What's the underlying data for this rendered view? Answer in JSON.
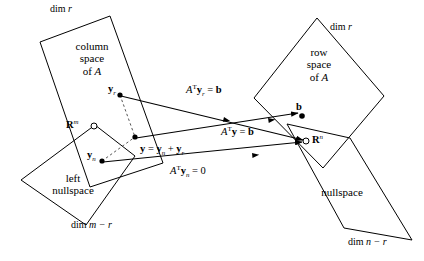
{
  "figure": {
    "stroke_color": "#000000",
    "background_color": "#ffffff",
    "dashed_color": "#555555"
  },
  "boxes": {
    "column_space": {
      "line1": "column",
      "line2": "space",
      "line3": "of",
      "matrix": "A",
      "dim_label_prefix": "dim",
      "dim_label_value": "r"
    },
    "row_space": {
      "line1": "row",
      "line2": "space",
      "line3": "of",
      "matrix": "A",
      "dim_label_prefix": "dim",
      "dim_label_value": "r"
    },
    "left_nullspace": {
      "line1": "left",
      "line2": "nullspace",
      "dim_label_prefix": "dim",
      "dim_label_value": "m − r"
    },
    "nullspace": {
      "line1": "nullspace",
      "dim_label_prefix": "dim",
      "dim_label_value": "n − r"
    }
  },
  "space_markers": {
    "domain": {
      "symbol": "R",
      "exponent": "m"
    },
    "codomain": {
      "symbol": "R",
      "exponent": "n"
    }
  },
  "points": {
    "y_r": {
      "symbol": "y",
      "subscript": "r"
    },
    "y_n": {
      "symbol": "y",
      "subscript": "n"
    },
    "b": {
      "symbol": "b"
    }
  },
  "equations": {
    "top": {
      "matrix": "A",
      "transpose": "T",
      "vector": "y",
      "subscript": "r",
      "relation": "=",
      "result": "b"
    },
    "middle": {
      "matrix": "A",
      "transpose": "T",
      "vector": "y",
      "subscript": "",
      "relation": "=",
      "result": "b"
    },
    "bottom": {
      "matrix": "A",
      "transpose": "T",
      "vector": "y",
      "subscript": "n",
      "relation": "=",
      "result": "0"
    },
    "decomposition": {
      "lhs": "y",
      "relation": "=",
      "term1": "y",
      "term1_sub": "n",
      "operator": "+",
      "term2": "y",
      "term2_sub": "r"
    }
  }
}
